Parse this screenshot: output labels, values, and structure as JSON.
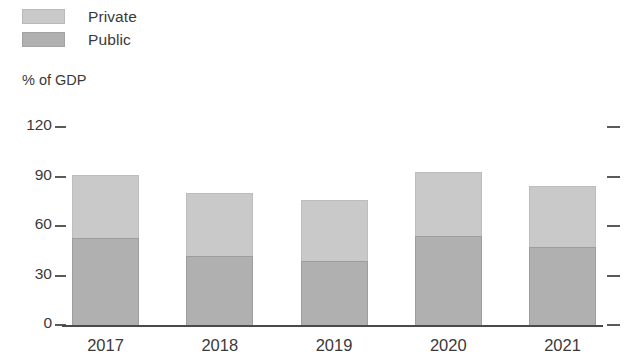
{
  "legend": {
    "items": [
      {
        "label": "Private",
        "color": "#c9c9c9",
        "swatch_name": "legend-swatch-private"
      },
      {
        "label": "Public",
        "color": "#b0b0b0",
        "swatch_name": "legend-swatch-public"
      }
    ]
  },
  "axis": {
    "y_title": "% of GDP",
    "y_ticks": [
      "0",
      "30",
      "60",
      "90",
      "120"
    ],
    "x_ticks": [
      "2017",
      "2018",
      "2019",
      "2020",
      "2021"
    ]
  },
  "chart_data": {
    "type": "bar",
    "title": "",
    "subtitle": "",
    "xlabel": "",
    "ylabel": "% of GDP",
    "stacked": true,
    "grid": false,
    "legend_position": "top-left",
    "categories": [
      "2017",
      "2018",
      "2019",
      "2020",
      "2021"
    ],
    "ylim": [
      0,
      120
    ],
    "yticks": [
      0,
      30,
      60,
      90,
      120
    ],
    "series": [
      {
        "name": "Public",
        "color": "#b0b0b0",
        "values": [
          53,
          42,
          39,
          54,
          47
        ]
      },
      {
        "name": "Private",
        "color": "#c9c9c9",
        "values": [
          38,
          38,
          37,
          39,
          37
        ]
      }
    ],
    "totals": [
      91,
      80,
      76,
      93,
      84
    ],
    "annotations": []
  }
}
